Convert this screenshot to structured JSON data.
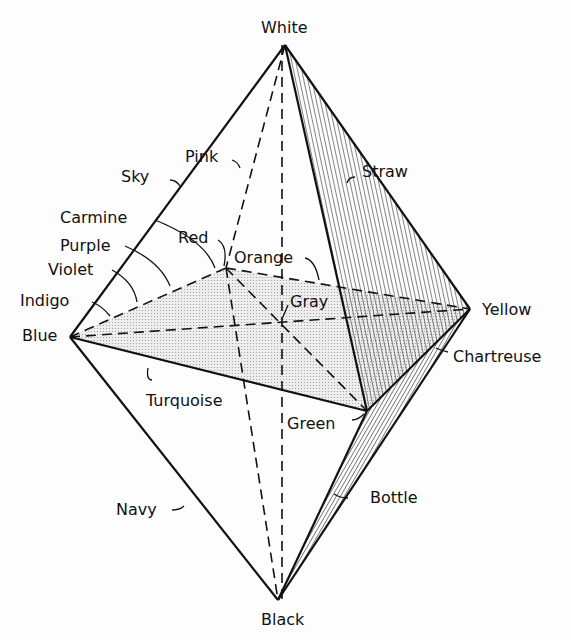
{
  "diagram": {
    "type": "color solid (double pyramid / octahedron)",
    "vertices": {
      "top": "White",
      "bottom": "Black",
      "left": "Blue",
      "right": "Yellow",
      "back_left": "Red",
      "front_right": "Green",
      "center": "Gray"
    },
    "labels": {
      "white": "White",
      "black": "Black",
      "blue": "Blue",
      "yellow": "Yellow",
      "sky": "Sky",
      "pink": "Pink",
      "straw": "Straw",
      "carmine": "Carmine",
      "purple": "Purple",
      "violet": "Violet",
      "indigo": "Indigo",
      "red": "Red",
      "orange": "Orange",
      "gray": "Gray",
      "chartreuse": "Chartreuse",
      "turquoise": "Turquoise",
      "green": "Green",
      "navy": "Navy",
      "bottle": "Bottle"
    },
    "colors": {
      "ink": "#111111",
      "stipple": "#d9d9d9",
      "background": "#fdfdfd"
    }
  }
}
